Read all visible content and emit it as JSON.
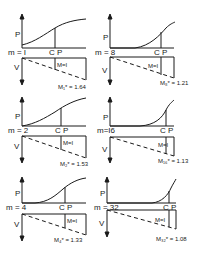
{
  "figure": {
    "axis_labels": {
      "p": "P",
      "v": "V"
    },
    "cp_label": "C P",
    "panels": [
      {
        "m_label": "m = I",
        "moment_label": "M=I",
        "mstar_label": "M₁* = 1.64"
      },
      {
        "m_label": "m = 8",
        "moment_label": "M=I",
        "mstar_label": "M₈* = 1.21"
      },
      {
        "m_label": "m = 2",
        "moment_label": "M=I",
        "mstar_label": "M₂* = 1.53"
      },
      {
        "m_label": "m=I6",
        "moment_label": "M=I",
        "mstar_label": "M₁₆* = 1.13"
      },
      {
        "m_label": "m = 4",
        "moment_label": "M=I",
        "mstar_label": "M₄* = 1.33"
      },
      {
        "m_label": "m = 32",
        "moment_label": "M=I",
        "mstar_label": "M₃₂* = 1.08"
      }
    ]
  }
}
